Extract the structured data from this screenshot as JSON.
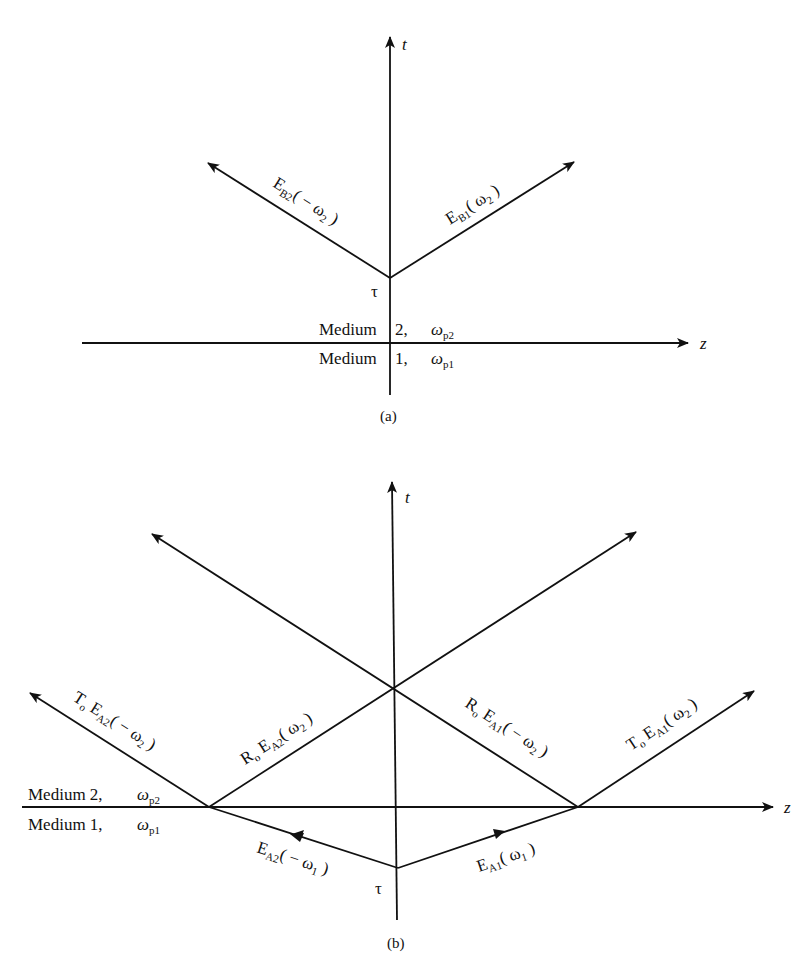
{
  "figure": {
    "panel_a": {
      "caption": "(a)",
      "axes": {
        "t_label": "t",
        "z_label": "z"
      },
      "vertex_label": "τ",
      "medium_top": {
        "name": "Medium",
        "index": "2,",
        "omega": "ω",
        "sub": "p2"
      },
      "medium_bottom": {
        "name": "Medium",
        "index": "1,",
        "omega": "ω",
        "sub": "p1"
      },
      "waves": [
        {
          "main": "E",
          "sub": "B2",
          "arg": "( − ω",
          "arg_sub": "2",
          "close": " )",
          "direction": "up-left"
        },
        {
          "main": "E",
          "sub": "B1",
          "arg": "( ω",
          "arg_sub": "2",
          "close": " )",
          "direction": "up-right"
        }
      ]
    },
    "panel_b": {
      "caption": "(b)",
      "axes": {
        "t_label": "t",
        "z_label": "z"
      },
      "vertex_label": "τ",
      "medium_top": {
        "name": "Medium 2,",
        "omega": "ω",
        "sub": "p2"
      },
      "medium_bottom": {
        "name": "Medium 1,",
        "omega": "ω",
        "sub": "p1"
      },
      "waves": [
        {
          "pre": "T",
          "pre_sub": "o",
          "main": " E",
          "sub": "A2",
          "arg": "( − ω",
          "arg_sub": "2",
          "close": " )",
          "role": "transmitted-left"
        },
        {
          "pre": "R",
          "pre_sub": "o",
          "main": " E",
          "sub": "A2",
          "arg": "( ω",
          "arg_sub": "2",
          "close": " )",
          "role": "reflected-left"
        },
        {
          "pre": "R",
          "pre_sub": "o",
          "main": " E",
          "sub": "A1",
          "arg": "( − ω",
          "arg_sub": "2",
          "close": " )",
          "role": "reflected-right"
        },
        {
          "pre": "T",
          "pre_sub": "o",
          "main": " E",
          "sub": "A1",
          "arg": "( ω",
          "arg_sub": "2",
          "close": " )",
          "role": "transmitted-right"
        },
        {
          "pre": "",
          "pre_sub": "",
          "main": "E",
          "sub": "A2",
          "arg": "( − ω",
          "arg_sub": "1",
          "close": " )",
          "role": "incident-left"
        },
        {
          "pre": "",
          "pre_sub": "",
          "main": "E",
          "sub": "A1",
          "arg": "( ω",
          "arg_sub": "1",
          "close": " )",
          "role": "incident-right"
        }
      ]
    }
  }
}
